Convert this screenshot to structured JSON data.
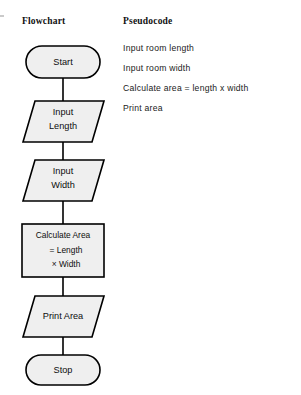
{
  "figure": {
    "columns": {
      "flowchart_heading": "Flowchart",
      "pseudocode_heading": "Pseudocode"
    }
  },
  "flowchart": {
    "nodes": [
      {
        "id": "start",
        "shape": "terminator",
        "label": "Start"
      },
      {
        "id": "input_len",
        "shape": "parallelogram",
        "label_line1": "Input",
        "label_line2": "Length"
      },
      {
        "id": "input_wid",
        "shape": "parallelogram",
        "label_line1": "Input",
        "label_line2": "Width"
      },
      {
        "id": "calc_area",
        "shape": "process",
        "label_line1": "Calculate Area",
        "label_line2": "= Length",
        "label_line3": "× Width"
      },
      {
        "id": "print_area",
        "shape": "parallelogram",
        "label": "Print Area"
      },
      {
        "id": "stop",
        "shape": "terminator",
        "label": "Stop"
      }
    ],
    "colors": {
      "shape_fill": "#efefef",
      "shape_stroke": "#000000",
      "connector": "#000000"
    }
  },
  "pseudocode": {
    "lines": [
      "Input room length",
      "Input room width",
      "Calculate area  =  length x width",
      "Print area"
    ]
  }
}
